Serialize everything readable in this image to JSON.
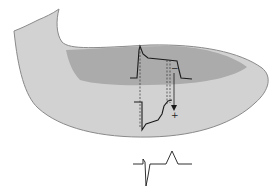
{
  "diagram": {
    "colors": {
      "outer_wall": "#d2d2d2",
      "inner_region": "#ababab",
      "outline": "#8a8a8a",
      "trace": "#1a1a1a"
    },
    "labels": {
      "minus_sign": "−",
      "plus_sign": "+"
    },
    "elements": [
      "ventricle-wall-shape",
      "endocardial-region",
      "upper-action-potential",
      "lower-inverted-action-potential",
      "dashed-alignment-lines",
      "vector-arrow",
      "ecg-trace"
    ]
  }
}
